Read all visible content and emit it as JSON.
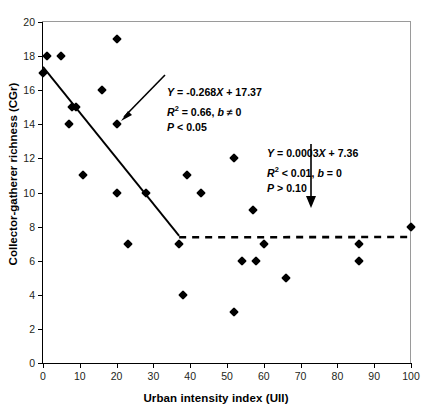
{
  "chart_data": {
    "type": "scatter",
    "title": "",
    "xlabel": "Urban intensity index (UII)",
    "ylabel": "Collector-gatherer richness (CGr)",
    "xlim": [
      0,
      100
    ],
    "ylim": [
      0,
      20
    ],
    "xticks": [
      0,
      10,
      20,
      30,
      40,
      50,
      60,
      70,
      80,
      90,
      100
    ],
    "yticks": [
      0,
      2,
      4,
      6,
      8,
      10,
      12,
      14,
      16,
      18,
      20
    ],
    "grid": false,
    "legend": "none",
    "marker": "black-diamond",
    "points": [
      {
        "x": 0,
        "y": 17
      },
      {
        "x": 1,
        "y": 18
      },
      {
        "x": 5,
        "y": 18
      },
      {
        "x": 7,
        "y": 14
      },
      {
        "x": 8,
        "y": 15
      },
      {
        "x": 9,
        "y": 15
      },
      {
        "x": 11,
        "y": 11
      },
      {
        "x": 16,
        "y": 16
      },
      {
        "x": 20,
        "y": 19
      },
      {
        "x": 20,
        "y": 14
      },
      {
        "x": 20,
        "y": 10
      },
      {
        "x": 23,
        "y": 7
      },
      {
        "x": 28,
        "y": 10
      },
      {
        "x": 37,
        "y": 7
      },
      {
        "x": 38,
        "y": 4
      },
      {
        "x": 39,
        "y": 11
      },
      {
        "x": 43,
        "y": 10
      },
      {
        "x": 52,
        "y": 12
      },
      {
        "x": 52,
        "y": 3
      },
      {
        "x": 54,
        "y": 6
      },
      {
        "x": 57,
        "y": 9
      },
      {
        "x": 58,
        "y": 6
      },
      {
        "x": 60,
        "y": 7
      },
      {
        "x": 66,
        "y": 5
      },
      {
        "x": 86,
        "y": 7
      },
      {
        "x": 86,
        "y": 6
      },
      {
        "x": 100,
        "y": 8
      }
    ],
    "series": [
      {
        "name": "solid-regression-line",
        "style": "solid",
        "equation": "Y = -0.268X + 17.37",
        "slope": -0.268,
        "intercept": 17.37,
        "x_range": [
          0,
          37
        ]
      },
      {
        "name": "dashed-regression-line",
        "style": "dashed",
        "equation": "Y = 0.0003X + 7.36",
        "slope": 0.0003,
        "intercept": 7.36,
        "x_range": [
          37,
          100
        ]
      }
    ],
    "annotations": [
      {
        "name": "solid-line-stats",
        "line1_y": "Y",
        "line1_eq": " = -0.268",
        "line1_x": "X",
        "line1_tail": " + 17.37",
        "line2_r": "R",
        "line2_sup": "2",
        "line2_tail": " = 0.66, ",
        "line2_b": "b",
        "line2_b_tail": " ≠ 0",
        "line3_p": "P",
        "line3_tail": " < 0.05"
      },
      {
        "name": "dashed-line-stats",
        "line1_y": "Y",
        "line1_eq": " = 0.0003",
        "line1_x": "X",
        "line1_tail": " + 7.36",
        "line2_r": "R",
        "line2_sup": "2",
        "line2_tail": " < 0.01, ",
        "line2_b": "b",
        "line2_b_tail": " = 0",
        "line3_p": "P",
        "line3_tail": " > 0.10"
      }
    ]
  }
}
